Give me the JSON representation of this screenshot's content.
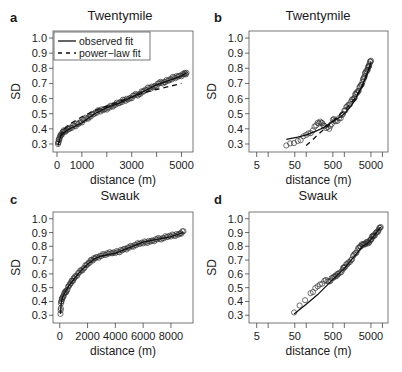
{
  "chart_data": [
    {
      "panel": "a",
      "type": "scatter",
      "title": "Twentymile",
      "xlabel": "distance (m)",
      "ylabel": "SD",
      "xscale": "linear",
      "xlim": [
        0,
        5300
      ],
      "ylim": [
        0.28,
        1.02
      ],
      "xticks": [
        0,
        1000,
        2000,
        3000,
        4000,
        5000
      ],
      "xtick_labels": [
        "0",
        "1000",
        "",
        "3000",
        "",
        "5000"
      ],
      "yticks": [
        0.3,
        0.4,
        0.5,
        0.6,
        0.7,
        0.8,
        0.9,
        1.0
      ],
      "ytick_labels": [
        "0.3",
        "0.4",
        "0.5",
        "0.6",
        "0.7",
        "0.8",
        "0.9",
        "1.0"
      ],
      "legend": {
        "position": "top-left",
        "entries": [
          {
            "label": "observed fit",
            "style": "solid"
          },
          {
            "label": "power−law fit",
            "style": "dashed"
          }
        ]
      },
      "series": [
        {
          "name": "observations",
          "style": "open-circles",
          "x": [
            40,
            80,
            150,
            250,
            350,
            500,
            700,
            900,
            1100,
            1300,
            1500,
            1700,
            1900,
            2100,
            2300,
            2500,
            2700,
            2900,
            3100,
            3300,
            3500,
            3700,
            3900,
            4100,
            4300,
            4500,
            4700,
            4900,
            5100,
            5200
          ],
          "y": [
            0.3,
            0.33,
            0.36,
            0.38,
            0.39,
            0.4,
            0.42,
            0.44,
            0.46,
            0.48,
            0.5,
            0.52,
            0.53,
            0.54,
            0.56,
            0.57,
            0.59,
            0.6,
            0.62,
            0.63,
            0.65,
            0.67,
            0.68,
            0.7,
            0.71,
            0.72,
            0.74,
            0.75,
            0.76,
            0.77
          ]
        },
        {
          "name": "observed fit",
          "style": "solid",
          "x": [
            40,
            150,
            300,
            500,
            1000,
            1500,
            2000,
            2500,
            3000,
            3500,
            4000,
            4500,
            5000,
            5200
          ],
          "y": [
            0.3,
            0.35,
            0.38,
            0.4,
            0.44,
            0.5,
            0.54,
            0.57,
            0.61,
            0.65,
            0.69,
            0.72,
            0.75,
            0.77
          ]
        },
        {
          "name": "power-law fit",
          "style": "dashed",
          "x": [
            40,
            150,
            300,
            500,
            1000,
            1500,
            2000,
            2500,
            3000,
            3500,
            4000,
            4500,
            5000
          ],
          "y": [
            0.29,
            0.36,
            0.4,
            0.43,
            0.48,
            0.52,
            0.55,
            0.58,
            0.61,
            0.64,
            0.66,
            0.68,
            0.7
          ]
        }
      ]
    },
    {
      "panel": "b",
      "type": "scatter",
      "title": "Twentymile",
      "xlabel": "distance (m)",
      "ylabel": "SD",
      "xscale": "log",
      "xlim": [
        4,
        11000
      ],
      "ylim": [
        0.28,
        1.02
      ],
      "xticks": [
        5,
        10,
        50,
        100,
        500,
        1000,
        5000,
        10000
      ],
      "xtick_labels": [
        "5",
        "",
        "50",
        "",
        "500",
        "",
        "5000",
        ""
      ],
      "yticks": [
        0.3,
        0.4,
        0.5,
        0.6,
        0.7,
        0.8,
        0.9,
        1.0
      ],
      "ytick_labels": [
        "0.3",
        "0.4",
        "0.5",
        "0.6",
        "0.7",
        "0.8",
        "0.9",
        "1.0"
      ],
      "series": [
        {
          "name": "observations",
          "style": "open-circles",
          "x": [
            30,
            60,
            100,
            150,
            200,
            250,
            300,
            400,
            500,
            600,
            800,
            1000,
            1200,
            1500,
            1800,
            2000,
            2300,
            2600,
            3000,
            3300,
            3600,
            4000,
            4300,
            4600,
            5000
          ],
          "y": [
            0.29,
            0.32,
            0.36,
            0.39,
            0.44,
            0.44,
            0.42,
            0.4,
            0.46,
            0.45,
            0.47,
            0.52,
            0.55,
            0.58,
            0.6,
            0.63,
            0.65,
            0.68,
            0.71,
            0.74,
            0.77,
            0.79,
            0.81,
            0.83,
            0.85
          ]
        },
        {
          "name": "observed fit",
          "style": "solid",
          "x": [
            30,
            60,
            100,
            200,
            300,
            500,
            800,
            1000,
            1500,
            2000,
            3000,
            4000,
            5000
          ],
          "y": [
            0.33,
            0.345,
            0.36,
            0.39,
            0.41,
            0.45,
            0.48,
            0.5,
            0.55,
            0.6,
            0.69,
            0.77,
            0.84
          ]
        },
        {
          "name": "power-law fit",
          "style": "dashed",
          "x": [
            100,
            150,
            200,
            300,
            500,
            800,
            1000,
            1500,
            2000,
            3000,
            4000,
            5000
          ],
          "y": [
            0.29,
            0.33,
            0.36,
            0.4,
            0.45,
            0.5,
            0.52,
            0.57,
            0.61,
            0.68,
            0.76,
            0.83
          ]
        }
      ]
    },
    {
      "panel": "c",
      "type": "scatter",
      "title": "Swauk",
      "xlabel": "distance (m)",
      "ylabel": "SD",
      "xscale": "linear",
      "xlim": [
        -200,
        9300
      ],
      "ylim": [
        0.28,
        1.02
      ],
      "xticks": [
        0,
        2000,
        4000,
        6000,
        8000
      ],
      "xtick_labels": [
        "0",
        "2000",
        "4000",
        "6000",
        "8000"
      ],
      "yticks": [
        0.3,
        0.4,
        0.5,
        0.6,
        0.7,
        0.8,
        0.9,
        1.0
      ],
      "ytick_labels": [
        "0.3",
        "0.4",
        "0.5",
        "0.6",
        "0.7",
        "0.8",
        "0.9",
        "1.0"
      ],
      "series": [
        {
          "name": "observations",
          "style": "open-circles",
          "x": [
            50,
            100,
            200,
            350,
            500,
            700,
            900,
            1100,
            1400,
            1700,
            2000,
            2300,
            2600,
            3000,
            3400,
            3800,
            4200,
            4600,
            5000,
            5400,
            5800,
            6200,
            6600,
            7000,
            7400,
            7800,
            8200,
            8600,
            8900
          ],
          "y": [
            0.31,
            0.4,
            0.43,
            0.46,
            0.48,
            0.52,
            0.55,
            0.58,
            0.61,
            0.64,
            0.67,
            0.7,
            0.72,
            0.73,
            0.75,
            0.75,
            0.76,
            0.78,
            0.79,
            0.81,
            0.82,
            0.83,
            0.84,
            0.85,
            0.86,
            0.87,
            0.88,
            0.89,
            0.91
          ]
        },
        {
          "name": "observed fit",
          "style": "solid",
          "x": [
            50,
            100,
            200,
            400,
            700,
            1000,
            1500,
            2000,
            2500,
            3000,
            4000,
            5000,
            6000,
            7000,
            8000,
            8900
          ],
          "y": [
            0.31,
            0.39,
            0.43,
            0.47,
            0.52,
            0.56,
            0.62,
            0.67,
            0.71,
            0.73,
            0.75,
            0.79,
            0.83,
            0.85,
            0.87,
            0.9
          ]
        }
      ]
    },
    {
      "panel": "d",
      "type": "scatter",
      "title": "Swauk",
      "xlabel": "distance (m)",
      "ylabel": "SD",
      "xscale": "log",
      "xlim": [
        4,
        11000
      ],
      "ylim": [
        0.28,
        1.02
      ],
      "xticks": [
        5,
        10,
        50,
        100,
        500,
        1000,
        5000,
        10000
      ],
      "xtick_labels": [
        "5",
        "",
        "50",
        "",
        "500",
        "",
        "5000",
        ""
      ],
      "yticks": [
        0.3,
        0.4,
        0.5,
        0.6,
        0.7,
        0.8,
        0.9,
        1.0
      ],
      "ytick_labels": [
        "0.3",
        "0.4",
        "0.5",
        "0.6",
        "0.7",
        "0.8",
        "0.9",
        "1.0"
      ],
      "series": [
        {
          "name": "observations",
          "style": "open-circles",
          "x": [
            48,
            130,
            200,
            300,
            400,
            500,
            600,
            700,
            900,
            1000,
            1200,
            1500,
            1800,
            2200,
            2600,
            3000,
            3500,
            4000,
            4500,
            5000,
            5500,
            6000,
            7000,
            8000,
            9000
          ],
          "y": [
            0.32,
            0.46,
            0.51,
            0.55,
            0.545,
            0.57,
            0.59,
            0.6,
            0.63,
            0.65,
            0.67,
            0.7,
            0.74,
            0.77,
            0.8,
            0.81,
            0.82,
            0.83,
            0.83,
            0.85,
            0.87,
            0.88,
            0.9,
            0.92,
            0.94
          ]
        },
        {
          "name": "observed fit",
          "style": "solid",
          "x": [
            48,
            100,
            200,
            500,
            1000,
            2000,
            3000,
            4000,
            5000,
            7000,
            9000
          ],
          "y": [
            0.31,
            0.38,
            0.45,
            0.56,
            0.64,
            0.74,
            0.8,
            0.82,
            0.85,
            0.9,
            0.94
          ]
        }
      ]
    }
  ]
}
